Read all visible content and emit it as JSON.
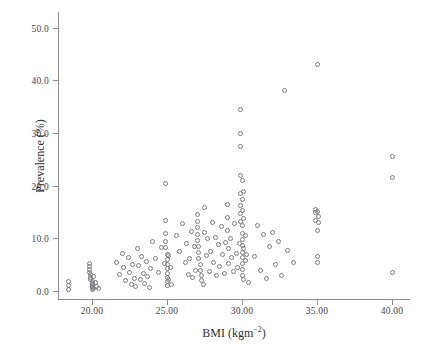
{
  "chart_data": {
    "type": "scatter",
    "title": "",
    "xlabel": "BMI (kgm−2)",
    "xlabel_base": "BMI (kgm",
    "xlabel_sup": "−2",
    "xlabel_tail": ")",
    "ylabel": "Prevalence (%)",
    "xlim": [
      17.8,
      41.2
    ],
    "ylim": [
      -1.5,
      53.0
    ],
    "xticks": [
      20.0,
      25.0,
      30.0,
      35.0,
      40.0
    ],
    "xticklabels": [
      "20.00",
      "25.00",
      "30.00",
      "35.00",
      "40.00"
    ],
    "yticks": [
      0.0,
      10.0,
      20.0,
      30.0,
      40.0,
      50.0
    ],
    "yticklabels": [
      "0.0",
      "10.0",
      "20.0",
      "30.0",
      "40.0",
      "50.0"
    ],
    "grid": false,
    "legend": false,
    "marker": "open-circle",
    "marker_color": "#7b7b82",
    "marker_size": 5,
    "x": [
      18.4,
      18.4,
      18.4,
      19.8,
      19.8,
      19.8,
      19.8,
      19.9,
      19.9,
      19.9,
      20.0,
      20.0,
      20.0,
      20.0,
      20.0,
      20.0,
      20.1,
      20.1,
      20.2,
      20.3,
      20.4,
      21.6,
      21.8,
      22.0,
      22.1,
      22.2,
      22.4,
      22.5,
      22.6,
      22.7,
      22.8,
      22.9,
      23.0,
      23.1,
      23.2,
      23.3,
      23.4,
      23.5,
      23.6,
      23.7,
      23.8,
      23.9,
      24.0,
      24.2,
      24.4,
      24.6,
      24.8,
      24.9,
      24.9,
      24.9,
      24.9,
      24.9,
      25.0,
      25.0,
      25.0,
      25.0,
      25.0,
      25.0,
      25.0,
      25.0,
      25.1,
      25.1,
      25.2,
      25.3,
      25.6,
      25.8,
      26.0,
      26.2,
      26.3,
      26.4,
      26.5,
      26.6,
      26.7,
      26.8,
      26.9,
      27.0,
      27.0,
      27.0,
      27.0,
      27.0,
      27.1,
      27.1,
      27.1,
      27.2,
      27.2,
      27.3,
      27.3,
      27.4,
      27.5,
      27.5,
      27.6,
      27.7,
      27.8,
      27.9,
      28.0,
      28.1,
      28.2,
      28.3,
      28.4,
      28.5,
      28.6,
      28.7,
      28.8,
      28.9,
      29.0,
      29.0,
      29.0,
      29.1,
      29.1,
      29.2,
      29.3,
      29.4,
      29.5,
      29.6,
      29.7,
      29.8,
      29.9,
      29.9,
      29.9,
      29.9,
      29.9,
      29.9,
      29.9,
      29.9,
      30.0,
      30.0,
      30.0,
      30.0,
      30.0,
      30.0,
      30.0,
      30.0,
      30.0,
      30.0,
      30.0,
      30.0,
      30.1,
      30.1,
      30.1,
      30.1,
      30.2,
      30.2,
      30.3,
      30.4,
      30.8,
      31.0,
      31.2,
      31.4,
      31.6,
      31.8,
      32.0,
      32.2,
      32.4,
      32.6,
      32.8,
      33.0,
      33.4,
      34.9,
      34.9,
      34.9,
      35.0,
      35.0,
      35.0,
      35.0,
      35.0,
      35.1,
      35.1,
      40.0,
      40.0,
      40.0
    ],
    "y": [
      1.9,
      1.0,
      0.3,
      5.2,
      4.6,
      4.1,
      3.6,
      3.1,
      2.6,
      2.2,
      1.9,
      1.5,
      1.2,
      0.9,
      0.6,
      0.3,
      2.8,
      0.5,
      1.6,
      0.8,
      0.4,
      5.5,
      3.1,
      7.2,
      4.4,
      2.0,
      6.3,
      3.6,
      1.2,
      5.0,
      2.4,
      0.9,
      8.0,
      4.8,
      2.2,
      6.5,
      3.3,
      1.4,
      5.7,
      2.8,
      0.7,
      4.2,
      9.4,
      6.1,
      3.5,
      8.3,
      5.2,
      20.5,
      13.5,
      11.0,
      9.5,
      8.2,
      7.0,
      6.0,
      5.0,
      4.2,
      3.4,
      2.6,
      1.8,
      1.0,
      6.8,
      2.2,
      4.5,
      1.3,
      10.5,
      7.6,
      12.8,
      5.4,
      9.0,
      3.2,
      6.2,
      11.4,
      2.5,
      8.4,
      4.0,
      14.5,
      13.2,
      12.0,
      10.8,
      9.6,
      8.4,
      7.3,
      6.2,
      5.1,
      4.0,
      3.0,
      2.1,
      1.3,
      15.8,
      11.2,
      6.8,
      9.9,
      3.8,
      7.5,
      13.0,
      5.5,
      10.2,
      2.9,
      8.8,
      4.6,
      12.3,
      6.9,
      3.3,
      9.3,
      16.5,
      14.0,
      11.6,
      8.0,
      5.2,
      10.0,
      6.4,
      3.8,
      12.8,
      7.2,
      4.4,
      9.1,
      34.5,
      30.0,
      27.5,
      22.0,
      18.5,
      16.2,
      14.8,
      13.3,
      21.0,
      17.3,
      15.4,
      12.5,
      11.0,
      9.8,
      8.6,
      7.4,
      6.3,
      5.2,
      4.1,
      3.0,
      19.0,
      13.8,
      8.0,
      2.2,
      10.5,
      5.8,
      7.0,
      1.6,
      6.5,
      12.5,
      4.0,
      10.8,
      2.4,
      8.5,
      11.2,
      5.0,
      9.5,
      3.0,
      38.0,
      7.8,
      5.5,
      15.5,
      14.9,
      13.5,
      43.0,
      15.2,
      11.5,
      6.5,
      5.5,
      14.2,
      13.0,
      25.5,
      21.5,
      3.5
    ]
  }
}
